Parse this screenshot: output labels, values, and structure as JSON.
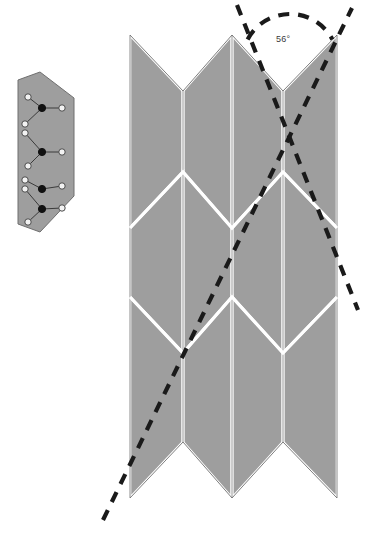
{
  "figure": {
    "background_color": "#ffffff",
    "panel_fill": "#9e9e9e",
    "panel_stroke": "#ffffff",
    "panel_edge_color": "#6f6f6f",
    "dash_color": "#1a1a1a",
    "node_open_fill": "#f2f2f2",
    "node_open_stroke": "#4a4a4a",
    "node_filled_fill": "#111111",
    "link_color": "#3a3a3a"
  },
  "annotations": {
    "angle": {
      "value": "56",
      "unit": "°",
      "text": "56°",
      "x": 276,
      "y": 34
    }
  },
  "inset": {
    "name": "unit-cell-graph-inset",
    "outline": [
      [
        40,
        72
      ],
      [
        74,
        98
      ],
      [
        74,
        196
      ],
      [
        40,
        232
      ],
      [
        18,
        224
      ],
      [
        18,
        80
      ]
    ],
    "nodes_open": [
      {
        "x": 28,
        "y": 97
      },
      {
        "x": 62,
        "y": 108
      },
      {
        "x": 25,
        "y": 124
      },
      {
        "x": 25,
        "y": 133
      },
      {
        "x": 62,
        "y": 152
      },
      {
        "x": 28,
        "y": 166
      },
      {
        "x": 25,
        "y": 180
      },
      {
        "x": 25,
        "y": 189
      },
      {
        "x": 62,
        "y": 186
      },
      {
        "x": 62,
        "y": 208
      },
      {
        "x": 28,
        "y": 222
      }
    ],
    "nodes_filled": [
      {
        "x": 42,
        "y": 108
      },
      {
        "x": 42,
        "y": 152
      },
      {
        "x": 42,
        "y": 189
      },
      {
        "x": 42,
        "y": 209
      }
    ],
    "edges": [
      [
        [
          28,
          97
        ],
        [
          42,
          108
        ]
      ],
      [
        [
          42,
          108
        ],
        [
          62,
          108
        ]
      ],
      [
        [
          25,
          124
        ],
        [
          42,
          108
        ]
      ],
      [
        [
          25,
          133
        ],
        [
          42,
          152
        ]
      ],
      [
        [
          42,
          152
        ],
        [
          62,
          152
        ]
      ],
      [
        [
          28,
          166
        ],
        [
          42,
          152
        ]
      ],
      [
        [
          25,
          180
        ],
        [
          42,
          189
        ]
      ],
      [
        [
          42,
          189
        ],
        [
          62,
          186
        ]
      ],
      [
        [
          25,
          189
        ],
        [
          42,
          209
        ]
      ],
      [
        [
          42,
          209
        ],
        [
          62,
          208
        ]
      ],
      [
        [
          28,
          222
        ],
        [
          42,
          209
        ]
      ]
    ]
  },
  "sheet": {
    "name": "miura-ori-sheet",
    "columns_x": [
      130,
      183,
      232,
      283,
      337
    ],
    "rows_y": [
      63,
      200,
      325,
      470
    ],
    "zigzag_amplitude": 28
  },
  "dashed_paths": {
    "incoming_ray": {
      "name": "incoming-ray",
      "from": [
        103,
        520
      ],
      "to": [
        352,
        8
      ]
    },
    "outgoing_ray": {
      "name": "outgoing-ray",
      "from": [
        237,
        5
      ],
      "to": [
        358,
        310
      ]
    },
    "angle_arc": {
      "name": "angle-arc",
      "cx": 290,
      "cy": 62,
      "r": 48,
      "start_deg": 208,
      "end_deg": 332
    }
  }
}
